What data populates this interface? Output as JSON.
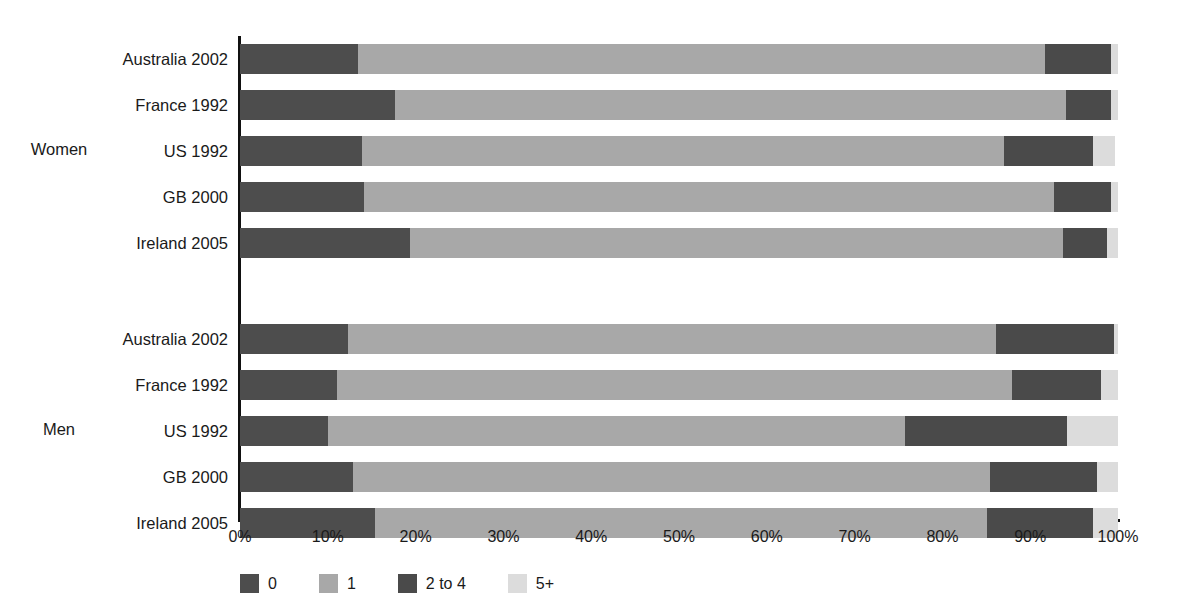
{
  "chart_data": {
    "type": "bar",
    "subtype": "stacked-horizontal-100",
    "title": "",
    "xlabel": "",
    "ylabel": "",
    "xlim": [
      0,
      100
    ],
    "grid": false,
    "legend_position": "bottom-left",
    "legend": [
      "0",
      "1",
      "2 to 4",
      "5+"
    ],
    "xticks": [
      "0%",
      "10%",
      "20%",
      "30%",
      "40%",
      "50%",
      "60%",
      "70%",
      "80%",
      "90%",
      "100%"
    ],
    "xtick_values": [
      0,
      10,
      20,
      30,
      40,
      50,
      60,
      70,
      80,
      90,
      100
    ],
    "series": [
      {
        "name": "0",
        "color": "#4d4d4d"
      },
      {
        "name": "1",
        "color": "#a8a8a8"
      },
      {
        "name": "2 to 4",
        "color": "#4a4a4a"
      },
      {
        "name": "5+",
        "color": "#dcdcdc"
      }
    ],
    "groups": [
      {
        "label": "Women",
        "categories": [
          {
            "label": "Australia 2002",
            "values": [
              13.4,
              78.3,
              7.5,
              0.8
            ]
          },
          {
            "label": "France 1992",
            "values": [
              17.6,
              76.5,
              5.1,
              0.8
            ]
          },
          {
            "label": "US 1992",
            "values": [
              13.9,
              73.1,
              10.1,
              2.6
            ]
          },
          {
            "label": "GB 2000",
            "values": [
              14.1,
              78.6,
              6.5,
              0.8
            ]
          },
          {
            "label": "Ireland 2005",
            "values": [
              19.4,
              74.3,
              5.0,
              1.3
            ]
          }
        ]
      },
      {
        "label": "Men",
        "categories": [
          {
            "label": "Australia 2002",
            "values": [
              12.3,
              73.8,
              13.4,
              0.5
            ]
          },
          {
            "label": "France 1992",
            "values": [
              11.1,
              76.8,
              10.2,
              1.9
            ]
          },
          {
            "label": "US 1992",
            "values": [
              10.0,
              65.7,
              18.5,
              5.8
            ]
          },
          {
            "label": "GB 2000",
            "values": [
              12.9,
              72.5,
              12.2,
              2.4
            ]
          },
          {
            "label": "Ireland 2005",
            "values": [
              15.4,
              69.7,
              12.0,
              2.9
            ]
          }
        ]
      }
    ]
  }
}
